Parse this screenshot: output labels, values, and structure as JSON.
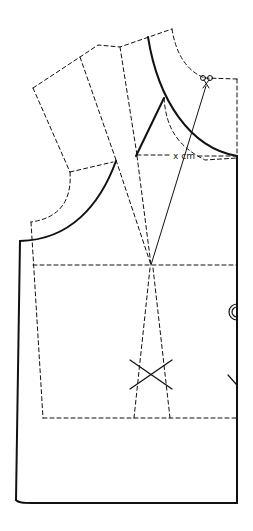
{
  "diagram": {
    "type": "sewing-pattern",
    "colors": {
      "line": "#111111",
      "background": "#ffffff"
    },
    "labels": {
      "measurement": "x cm"
    },
    "icons": {
      "cut_mark": "scissors-icon",
      "button_mark": "button-icon",
      "dart_point_mark": "cross-mark-icon"
    },
    "line_styles": {
      "solid": "final cutting line",
      "dashed": "original block / construction lines"
    }
  }
}
